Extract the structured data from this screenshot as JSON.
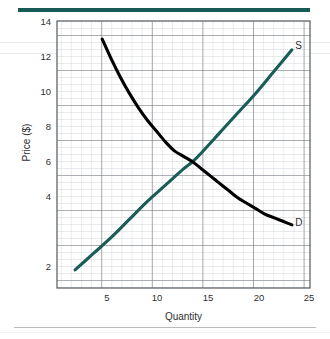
{
  "chart_data": {
    "type": "line",
    "title": "",
    "subtitle": "",
    "xlabel": "Quantity",
    "ylabel": "Price ($)",
    "xlim": [
      0,
      28
    ],
    "ylim": [
      0,
      14.8
    ],
    "xticks": [
      5,
      10,
      15,
      20,
      25
    ],
    "yticks": [
      2,
      4,
      6,
      8,
      10,
      12,
      14
    ],
    "grid": true,
    "grid_minor": true,
    "grid_minor_step_x": 1,
    "grid_minor_step_y": 0.4,
    "legend_position": "inline-end-of-curve",
    "annotations": [
      {
        "text": "S",
        "x": 26.6,
        "y": 13.4
      },
      {
        "text": "D",
        "x": 26.6,
        "y": 3.6
      }
    ],
    "equilibrium": {
      "quantity": 15,
      "price": 7
    },
    "series": [
      {
        "name": "S",
        "label": "Supply",
        "color": "#1a5c56",
        "points": [
          {
            "x": 2,
            "y": 1.0
          },
          {
            "x": 4,
            "y": 1.9
          },
          {
            "x": 6,
            "y": 2.8
          },
          {
            "x": 8,
            "y": 3.8
          },
          {
            "x": 10,
            "y": 4.8
          },
          {
            "x": 12,
            "y": 5.7
          },
          {
            "x": 14,
            "y": 6.6
          },
          {
            "x": 15,
            "y": 7.0
          },
          {
            "x": 16,
            "y": 7.5
          },
          {
            "x": 18,
            "y": 8.6
          },
          {
            "x": 20,
            "y": 9.7
          },
          {
            "x": 22,
            "y": 10.8
          },
          {
            "x": 24,
            "y": 12.0
          },
          {
            "x": 26,
            "y": 13.2
          }
        ]
      },
      {
        "name": "D",
        "label": "Demand",
        "color": "#000000",
        "points": [
          {
            "x": 5,
            "y": 13.8
          },
          {
            "x": 6,
            "y": 12.7
          },
          {
            "x": 7,
            "y": 11.7
          },
          {
            "x": 8,
            "y": 10.8
          },
          {
            "x": 9,
            "y": 10.0
          },
          {
            "x": 10,
            "y": 9.3
          },
          {
            "x": 11,
            "y": 8.7
          },
          {
            "x": 12,
            "y": 8.1
          },
          {
            "x": 13,
            "y": 7.6
          },
          {
            "x": 14,
            "y": 7.3
          },
          {
            "x": 15,
            "y": 7.0
          },
          {
            "x": 16,
            "y": 6.6
          },
          {
            "x": 17,
            "y": 6.2
          },
          {
            "x": 18,
            "y": 5.8
          },
          {
            "x": 19,
            "y": 5.4
          },
          {
            "x": 20,
            "y": 5.0
          },
          {
            "x": 21,
            "y": 4.7
          },
          {
            "x": 22,
            "y": 4.4
          },
          {
            "x": 23,
            "y": 4.1
          },
          {
            "x": 24,
            "y": 3.9
          },
          {
            "x": 25,
            "y": 3.7
          },
          {
            "x": 26,
            "y": 3.5
          }
        ]
      }
    ]
  },
  "axis": {
    "x_title": "Quantity",
    "y_title": "Price ($)",
    "x_tick_labels": [
      "5",
      "10",
      "15",
      "20",
      "25"
    ],
    "y_tick_labels": [
      "14",
      "12",
      "10",
      "8",
      "6",
      "4",
      "2"
    ]
  },
  "curve_labels": {
    "supply": "S",
    "demand": "D"
  },
  "colors": {
    "supply": "#1a5c56",
    "demand": "#000000",
    "top_rule": "#165c55",
    "bottom_rule": "#b9bcbe",
    "grid_minor": "#c9ccd0",
    "grid_major": "#6f7479",
    "plot_border": "#555a5f"
  }
}
